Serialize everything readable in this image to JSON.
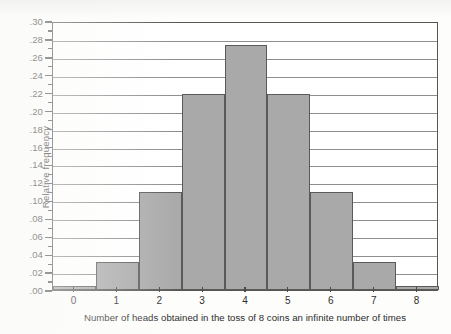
{
  "figure": {
    "background_color": "#fdfdfc",
    "bar_fill_color": "#a9a9a9",
    "bar_edge_color": "#5a5a5a",
    "grid_color": "#8d8d8d",
    "frame_color": "#555555"
  },
  "chart_data": {
    "type": "bar",
    "title": "",
    "subtitle": "",
    "xlabel": "Number of heads obtained in the toss of 8 coins an infinite number of times",
    "ylabel": "Relative frequency",
    "categories": [
      "0",
      "1",
      "2",
      "3",
      "4",
      "5",
      "6",
      "7",
      "8"
    ],
    "values": [
      0.004,
      0.031,
      0.109,
      0.219,
      0.273,
      0.219,
      0.109,
      0.031,
      0.004
    ],
    "xlim": [
      -0.5,
      8.5
    ],
    "ylim": [
      0.0,
      0.3
    ],
    "grid": true,
    "legend": null,
    "legend_position": "none",
    "y_ticks_major": [
      0.0,
      0.02,
      0.04,
      0.06,
      0.08,
      0.1,
      0.12,
      0.14,
      0.16,
      0.18,
      0.2,
      0.22,
      0.24,
      0.26,
      0.28,
      0.3
    ],
    "y_tick_labels": [
      ".00",
      ".02",
      ".04",
      ".06",
      ".08",
      ".10",
      ".12",
      ".14",
      ".16",
      ".18",
      ".20",
      ".22",
      ".24",
      ".26",
      ".28",
      ".30"
    ],
    "y_ticks_minor": [
      0.01,
      0.03,
      0.05,
      0.07,
      0.09,
      0.11,
      0.13,
      0.15,
      0.17,
      0.19,
      0.21,
      0.23,
      0.25,
      0.27,
      0.29
    ],
    "x_tick_labels": [
      "0",
      "1",
      "2",
      "3",
      "4",
      "5",
      "6",
      "7",
      "8"
    ]
  }
}
